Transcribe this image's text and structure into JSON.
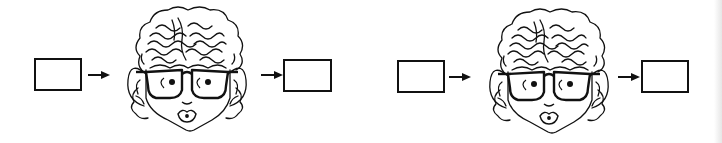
{
  "diagram": {
    "stroke_color": "#111111",
    "background_color": "#ffffff",
    "sequences": [
      {
        "input_box": {
          "label": ""
        },
        "arrow_in": {
          "icon": "right-arrow-icon"
        },
        "face": {
          "icon": "face-with-glasses-icon",
          "description": "curly-haired person wearing glasses, eyes looking right, pursed lips"
        },
        "arrow_out": {
          "icon": "right-arrow-icon"
        },
        "output_box": {
          "label": ""
        }
      },
      {
        "input_box": {
          "label": ""
        },
        "arrow_in": {
          "icon": "right-arrow-icon"
        },
        "face": {
          "icon": "face-with-glasses-icon",
          "description": "curly-haired person wearing glasses, eyes looking right, pursed lips"
        },
        "arrow_out": {
          "icon": "right-arrow-icon"
        },
        "output_box": {
          "label": ""
        }
      }
    ]
  }
}
